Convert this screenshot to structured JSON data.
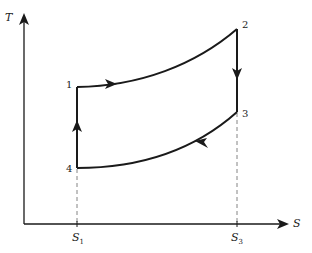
{
  "diagram": {
    "type": "T-S cycle diagram",
    "axes": {
      "y_label": "T",
      "x_label": "S",
      "x_ticks": [
        {
          "label": "S",
          "sub": "1"
        },
        {
          "label": "S",
          "sub": "3"
        }
      ]
    },
    "points": [
      {
        "id": "1",
        "label": "1"
      },
      {
        "id": "2",
        "label": "2"
      },
      {
        "id": "3",
        "label": "3"
      },
      {
        "id": "4",
        "label": "4"
      }
    ],
    "processes": [
      {
        "from": "1",
        "to": "2",
        "shape": "curve",
        "direction": "right"
      },
      {
        "from": "2",
        "to": "3",
        "shape": "vertical",
        "direction": "down"
      },
      {
        "from": "3",
        "to": "4",
        "shape": "curve",
        "direction": "left"
      },
      {
        "from": "4",
        "to": "1",
        "shape": "vertical",
        "direction": "up"
      }
    ],
    "colors": {
      "line": "#1a1a1a",
      "dashed": "#777777"
    }
  }
}
